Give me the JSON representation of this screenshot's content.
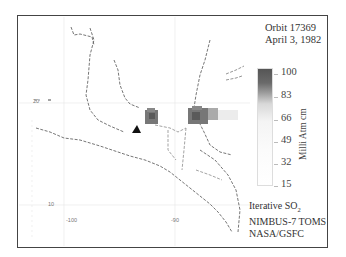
{
  "title": {
    "orbit": "Orbit 17369",
    "date": "April 3, 1982"
  },
  "colorbar": {
    "unit": "Milli Atm cm",
    "ticks": [
      "100",
      "83",
      "66",
      "49",
      "32",
      "15"
    ],
    "color_top": "#555555",
    "color_bottom": "#ffffff"
  },
  "credits": {
    "line1_prefix": "Iterative SO",
    "line1_sub": "2",
    "line2": "NIMBUS-7 TOMS",
    "line3": "NASA/GSFC"
  },
  "axes": {
    "lat_labels": [
      "20",
      "10"
    ],
    "lon_labels": [
      "-100",
      "-90"
    ]
  },
  "map": {
    "region": "Mexico and Central America",
    "features": [
      "SO2 plume west",
      "SO2 plume east",
      "El Chichón volcano marker"
    ]
  }
}
